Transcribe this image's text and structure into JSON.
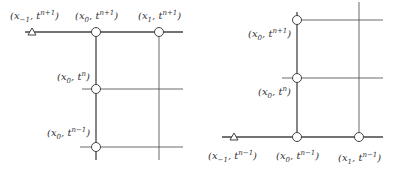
{
  "diagrams": [
    {
      "name": "left-stencil",
      "labels": {
        "xm1_np1": {
          "x": "x",
          "xsub": "−1",
          "t": "t",
          "tsup": "n+1"
        },
        "x0_np1": {
          "x": "x",
          "xsub": "0",
          "t": "t",
          "tsup": "n+1"
        },
        "x1_np1": {
          "x": "x",
          "xsub": "1",
          "t": "t",
          "tsup": "n+1"
        },
        "x0_n": {
          "x": "x",
          "xsub": "0",
          "t": "t",
          "tsup": "n"
        },
        "x0_nm1": {
          "x": "x",
          "xsub": "0",
          "t": "t",
          "tsup": "n−1"
        }
      }
    },
    {
      "name": "right-stencil",
      "labels": {
        "x0_np1": {
          "x": "x",
          "xsub": "0",
          "t": "t",
          "tsup": "n+1"
        },
        "x0_n": {
          "x": "x",
          "xsub": "0",
          "t": "t",
          "tsup": "n"
        },
        "xm1_nm1": {
          "x": "x",
          "xsub": "−1",
          "t": "t",
          "tsup": "n−1"
        },
        "x0_nm1": {
          "x": "x",
          "xsub": "0",
          "t": "t",
          "tsup": "n−1"
        },
        "x1_nm1": {
          "x": "x",
          "xsub": "1",
          "t": "t",
          "tsup": "n−1"
        }
      }
    }
  ],
  "colors": {
    "line": "#444444",
    "node_fill": "#ffffff",
    "node_stroke": "#444444"
  }
}
